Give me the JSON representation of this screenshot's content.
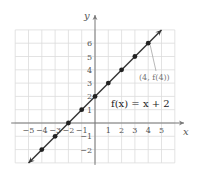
{
  "chart_data": {
    "type": "line",
    "title": "",
    "function_label": "f(x) = x + 2",
    "xlabel": "x",
    "ylabel": "y",
    "xlim": [
      -6,
      6
    ],
    "ylim": [
      -3,
      7
    ],
    "grid": true,
    "x_ticks": [
      -5,
      -4,
      -3,
      -2,
      -1,
      1,
      2,
      3,
      4,
      5
    ],
    "y_ticks": [
      -2,
      -1,
      1,
      2,
      3,
      4,
      5,
      6
    ],
    "series": [
      {
        "name": "f(x) = x + 2",
        "x": [
          -4,
          -3,
          -2,
          -1,
          0,
          1,
          2,
          3,
          4
        ],
        "y": [
          -2,
          -1,
          0,
          1,
          2,
          3,
          4,
          5,
          6
        ]
      }
    ],
    "line_extent": {
      "from": [
        -5,
        -3
      ],
      "to": [
        5,
        7
      ]
    },
    "annotations": [
      {
        "text": "(4, f(4))",
        "point": [
          4,
          6
        ]
      }
    ]
  },
  "labels": {
    "x_axis": "x",
    "y_axis": "y",
    "equation": "f(x) = x + 2",
    "point_annotation": "(4, f(4))"
  }
}
